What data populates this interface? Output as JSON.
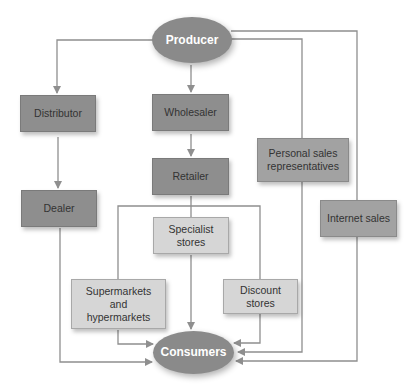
{
  "diagram": {
    "type": "distribution-channels-flowchart",
    "colors": {
      "dark_box": "#8e8e8e",
      "medium_box": "#a2a2a2",
      "light_box": "#d6d6d6",
      "ellipse": "#8a8a8a",
      "line": "#8f8f8f"
    },
    "nodes": {
      "producer": "Producer",
      "distributor": "Distributor",
      "dealer": "Dealer",
      "wholesaler": "Wholesaler",
      "retailer": "Retailer",
      "specialist": "Specialist stores",
      "supermarkets": "Supermarkets and hypermarkets",
      "discount": "Discount stores",
      "personal_sales": "Personal sales representatives",
      "internet_sales": "Internet sales",
      "consumers": "Consumers"
    },
    "edges": [
      [
        "Producer",
        "Distributor"
      ],
      [
        "Distributor",
        "Dealer"
      ],
      [
        "Dealer",
        "Consumers"
      ],
      [
        "Producer",
        "Wholesaler"
      ],
      [
        "Wholesaler",
        "Retailer"
      ],
      [
        "Retailer",
        "Specialist stores"
      ],
      [
        "Retailer",
        "Supermarkets and hypermarkets"
      ],
      [
        "Retailer",
        "Discount stores"
      ],
      [
        "Specialist stores",
        "Consumers"
      ],
      [
        "Supermarkets and hypermarkets",
        "Consumers"
      ],
      [
        "Discount stores",
        "Consumers"
      ],
      [
        "Producer",
        "Personal sales representatives"
      ],
      [
        "Personal sales representatives",
        "Consumers"
      ],
      [
        "Producer",
        "Internet sales"
      ],
      [
        "Internet sales",
        "Consumers"
      ]
    ]
  }
}
